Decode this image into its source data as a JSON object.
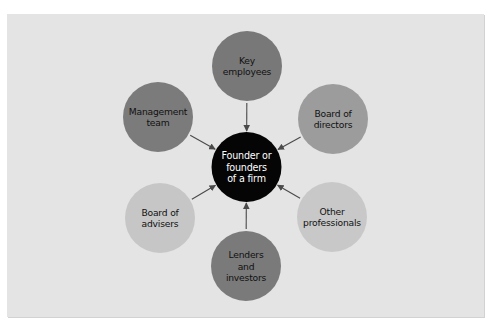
{
  "diagram": {
    "type": "hub-and-spoke",
    "background_color": "#e4e4e4",
    "arrow_color": "#4a4a4a",
    "center": {
      "id": "founder",
      "lines": [
        "Founder or",
        "founders",
        "of a firm"
      ],
      "fill": "#050505",
      "text_color": "#ffffff"
    },
    "nodes": [
      {
        "id": "key-employees",
        "lines": [
          "Key",
          "employees"
        ],
        "fill": "#787878",
        "text_color": "#111111",
        "position": "top"
      },
      {
        "id": "board-of-directors",
        "lines": [
          "Board of",
          "directors"
        ],
        "fill": "#9c9c9c",
        "text_color": "#111111",
        "position": "top-right"
      },
      {
        "id": "other-professionals",
        "lines": [
          "Other",
          "professionals"
        ],
        "fill": "#c8c8c8",
        "text_color": "#111111",
        "position": "bottom-right"
      },
      {
        "id": "lenders-and-investors",
        "lines": [
          "Lenders",
          "and",
          "investors"
        ],
        "fill": "#7a7a7a",
        "text_color": "#111111",
        "position": "bottom"
      },
      {
        "id": "board-of-advisers",
        "lines": [
          "Board of",
          "advisers"
        ],
        "fill": "#c6c6c6",
        "text_color": "#111111",
        "position": "bottom-left"
      },
      {
        "id": "management-team",
        "lines": [
          "Management",
          "team"
        ],
        "fill": "#7b7b7b",
        "text_color": "#111111",
        "position": "top-left"
      }
    ],
    "edges": [
      {
        "from": "key-employees",
        "to": "founder"
      },
      {
        "from": "board-of-directors",
        "to": "founder"
      },
      {
        "from": "other-professionals",
        "to": "founder"
      },
      {
        "from": "lenders-and-investors",
        "to": "founder"
      },
      {
        "from": "board-of-advisers",
        "to": "founder"
      },
      {
        "from": "management-team",
        "to": "founder"
      }
    ]
  }
}
